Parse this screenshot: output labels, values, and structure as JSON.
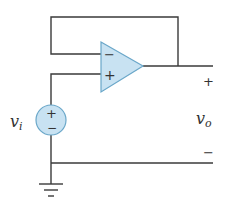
{
  "diagram": {
    "type": "circuit",
    "colors": {
      "wire": "#3a3a3a",
      "component_fill": "#c8e2f2",
      "component_stroke": "#6aa7c9"
    },
    "opamp": {
      "inverting_symbol": "−",
      "noninverting_symbol": "+"
    },
    "source": {
      "label_main": "v",
      "label_sub": "i",
      "plus_symbol": "+",
      "minus_symbol": "−"
    },
    "output": {
      "label_main": "v",
      "label_sub": "o",
      "plus_symbol": "+",
      "minus_symbol": "−"
    },
    "ground": {
      "symbol": "ground"
    }
  }
}
